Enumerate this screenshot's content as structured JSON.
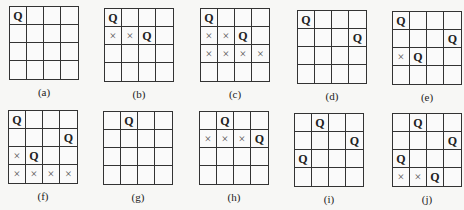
{
  "legend": {
    "queen_symbol": "Q",
    "attacked_symbol": "×"
  },
  "boards": [
    {
      "label": "(a)",
      "pos": [
        9,
        6
      ],
      "rows": [
        [
          "Q",
          "",
          "",
          ""
        ],
        [
          "",
          "",
          "",
          ""
        ],
        [
          "",
          "",
          "",
          ""
        ],
        [
          "",
          "",
          "",
          ""
        ]
      ]
    },
    {
      "label": "(b)",
      "pos": [
        104,
        8
      ],
      "rows": [
        [
          "Q",
          "",
          "",
          ""
        ],
        [
          "×",
          "×",
          "Q",
          ""
        ],
        [
          "",
          "",
          "",
          ""
        ],
        [
          "",
          "",
          "",
          ""
        ]
      ]
    },
    {
      "label": "(c)",
      "pos": [
        200,
        8
      ],
      "rows": [
        [
          "Q",
          "",
          "",
          ""
        ],
        [
          "×",
          "×",
          "Q",
          ""
        ],
        [
          "×",
          "×",
          "×",
          "×"
        ],
        [
          "",
          "",
          "",
          ""
        ]
      ]
    },
    {
      "label": "(d)",
      "pos": [
        297,
        10
      ],
      "rows": [
        [
          "Q",
          "",
          "",
          ""
        ],
        [
          "",
          "",
          "",
          "Q"
        ],
        [
          "",
          "",
          "",
          ""
        ],
        [
          "",
          "",
          "",
          ""
        ]
      ]
    },
    {
      "label": "(e)",
      "pos": [
        392,
        11
      ],
      "rows": [
        [
          "Q",
          "",
          "",
          ""
        ],
        [
          "",
          "",
          "",
          "Q"
        ],
        [
          "×",
          "Q",
          "",
          ""
        ],
        [
          "",
          "",
          "",
          ""
        ]
      ]
    },
    {
      "label": "(f)",
      "pos": [
        8,
        110
      ],
      "rows": [
        [
          "Q",
          "",
          "",
          ""
        ],
        [
          "",
          "",
          "",
          "Q"
        ],
        [
          "×",
          "Q",
          "",
          ""
        ],
        [
          "×",
          "×",
          "×",
          "×"
        ]
      ]
    },
    {
      "label": "(g)",
      "pos": [
        103,
        111
      ],
      "rows": [
        [
          "",
          "Q",
          "",
          ""
        ],
        [
          "",
          "",
          "",
          ""
        ],
        [
          "",
          "",
          "",
          ""
        ],
        [
          "",
          "",
          "",
          ""
        ]
      ]
    },
    {
      "label": "(h)",
      "pos": [
        199,
        111
      ],
      "rows": [
        [
          "",
          "Q",
          "",
          ""
        ],
        [
          "×",
          "×",
          "×",
          "Q"
        ],
        [
          "",
          "",
          "",
          ""
        ],
        [
          "",
          "",
          "",
          ""
        ]
      ]
    },
    {
      "label": "(i)",
      "pos": [
        294,
        113
      ],
      "rows": [
        [
          "",
          "Q",
          "",
          ""
        ],
        [
          "",
          "",
          "",
          "Q"
        ],
        [
          "Q",
          "",
          "",
          ""
        ],
        [
          "",
          "",
          "",
          ""
        ]
      ]
    },
    {
      "label": "(j)",
      "pos": [
        392,
        113
      ],
      "rows": [
        [
          "",
          "Q",
          "",
          ""
        ],
        [
          "",
          "",
          "",
          "Q"
        ],
        [
          "Q",
          "",
          "",
          ""
        ],
        [
          "×",
          "×",
          "Q",
          ""
        ]
      ]
    }
  ]
}
